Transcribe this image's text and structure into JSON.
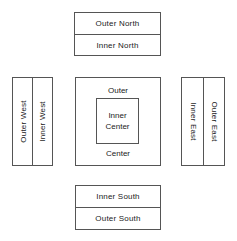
{
  "diagram": {
    "north": {
      "outer_label": "Outer North",
      "inner_label": "Inner North"
    },
    "west": {
      "outer_label": "Outer West",
      "inner_label": "Inner West"
    },
    "center": {
      "outer_label": "Outer",
      "inner_label_line1": "Inner",
      "inner_label_line2": "Center",
      "bottom_label": "Center"
    },
    "east": {
      "inner_label": "Inner East",
      "outer_label": "Outer East"
    },
    "south": {
      "inner_label": "Inner South",
      "outer_label": "Outer South"
    },
    "colors": {
      "border": "#555555",
      "text": "#222222",
      "background": "#ffffff"
    }
  }
}
